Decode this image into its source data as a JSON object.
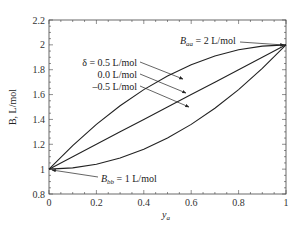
{
  "chart_data": {
    "type": "line",
    "title": "",
    "xlabel": "y_a",
    "ylabel": "B, L/mol",
    "xlim": [
      0,
      1
    ],
    "ylim": [
      0.8,
      2.2
    ],
    "grid": false,
    "x_ticks": [
      "0",
      "0.2",
      "0.4",
      "0.6",
      "0.8",
      "1"
    ],
    "y_ticks": [
      "0.8",
      "1",
      "1.2",
      "1.4",
      "1.6",
      "1.8",
      "2",
      "2.2"
    ],
    "x": [
      0,
      0.1,
      0.2,
      0.3,
      0.4,
      0.5,
      0.6,
      0.7,
      0.8,
      0.9,
      1.0
    ],
    "series": [
      {
        "name": "δ = 0.5 L/mol",
        "values": [
          1.0,
          1.19,
          1.36,
          1.51,
          1.64,
          1.75,
          1.84,
          1.91,
          1.96,
          1.99,
          2.0
        ]
      },
      {
        "name": "0.0 L/mol",
        "values": [
          1.0,
          1.1,
          1.2,
          1.3,
          1.4,
          1.5,
          1.6,
          1.7,
          1.8,
          1.9,
          2.0
        ]
      },
      {
        "name": "-0.5 L/mol",
        "values": [
          1.0,
          1.01,
          1.04,
          1.09,
          1.16,
          1.25,
          1.36,
          1.49,
          1.64,
          1.81,
          2.0
        ]
      }
    ],
    "annotations": [
      {
        "text": "B_aa = 2 L/mol",
        "points_to": [
          1.0,
          2.0
        ]
      },
      {
        "text": "B_bb = 1 L/mol",
        "points_to": [
          0.0,
          1.0
        ]
      },
      {
        "text": "δ = 0.5 L/mol",
        "points_to_series": 0
      },
      {
        "text": "0.0 L/mol",
        "points_to_series": 1
      },
      {
        "text": "-0.5 L/mol",
        "points_to_series": 2
      }
    ]
  },
  "labels": {
    "xlabel_main": "y",
    "xlabel_sub": "a",
    "ylabel": "B, L/mol",
    "baa_main": "B",
    "baa_sub": "aa",
    "baa_rest": " = 2 L/mol",
    "bbb_main": "B",
    "bbb_sub": "bb",
    "bbb_rest": " = 1 L/mol",
    "delta1": "δ = 0.5 L/mol",
    "delta2": "0.0 L/mol",
    "delta3": "–0.5 L/mol"
  }
}
